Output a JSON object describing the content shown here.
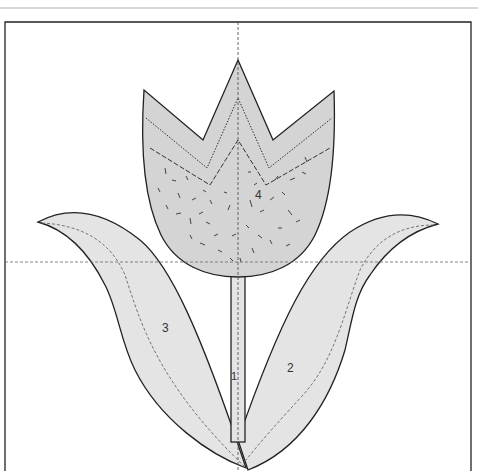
{
  "diagram": {
    "type": "applique-pattern",
    "colors": {
      "background": "#ffffff",
      "outline": "#222222",
      "fill_light": "#e4e4e4",
      "fill_flower": "#d4d4d4",
      "guide": "#666666",
      "rule": "#c8c8c8"
    },
    "pieces": [
      {
        "id": "1",
        "label": "1",
        "name": "stem"
      },
      {
        "id": "2",
        "label": "2",
        "name": "right-leaf"
      },
      {
        "id": "3",
        "label": "3",
        "name": "left-leaf"
      },
      {
        "id": "4",
        "label": "4",
        "name": "tulip-flower"
      }
    ]
  }
}
